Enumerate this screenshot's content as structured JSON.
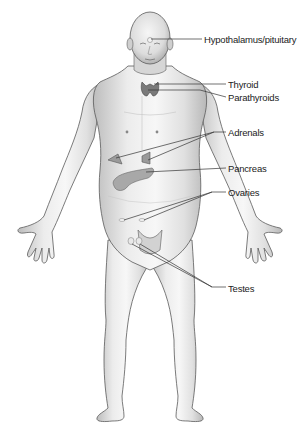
{
  "diagram": {
    "labels": [
      {
        "id": "hypothalamus",
        "text": "Hypothalamus/pituitary",
        "x": 204,
        "y": 35
      },
      {
        "id": "thyroid",
        "text": "Thyroid",
        "x": 228,
        "y": 80
      },
      {
        "id": "parathyroids",
        "text": "Parathyroids",
        "x": 228,
        "y": 93
      },
      {
        "id": "adrenals",
        "text": "Adrenals",
        "x": 228,
        "y": 128
      },
      {
        "id": "pancreas",
        "text": "Pancreas",
        "x": 228,
        "y": 164
      },
      {
        "id": "ovaries",
        "text": "Ovaries",
        "x": 228,
        "y": 188
      },
      {
        "id": "testes",
        "text": "Testes",
        "x": 228,
        "y": 284
      }
    ],
    "colors": {
      "skin_light": "#f2f2f2",
      "skin_mid": "#d9d9d9",
      "skin_shadow": "#b5b5b5",
      "outline": "#555555",
      "organ": "#9a9a9a",
      "leader_line": "#333333",
      "background": "#ffffff"
    }
  }
}
